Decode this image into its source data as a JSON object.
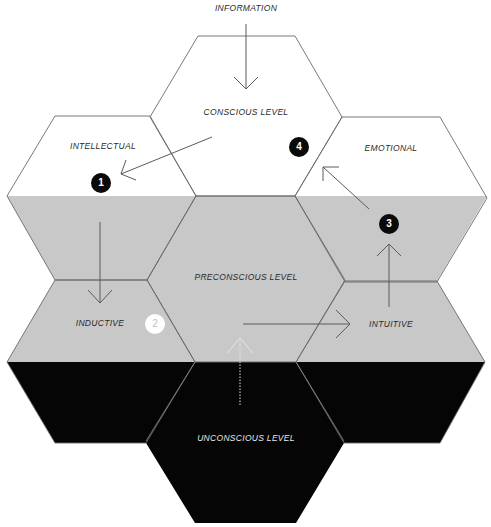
{
  "colors": {
    "white_band": "#ffffff",
    "gray_band": "#c8c8c8",
    "black_band": "#050505",
    "outline": "#6a6a6a",
    "arrow": "#5a5a5a",
    "arrow_light": "#e6e6e6"
  },
  "labels": {
    "information": "INFORMATION",
    "conscious": "CONSCIOUS LEVEL",
    "intellectual": "INTELLECTUAL",
    "emotional": "EMOTIONAL",
    "preconscious": "PRECONSCIOUS LEVEL",
    "inductive": "INDUCTIVE",
    "intuitive": "INTUITIVE",
    "unconscious": "UNCONSCIOUS LEVEL"
  },
  "badges": [
    {
      "number": "1",
      "style": "black"
    },
    {
      "number": "2",
      "style": "white"
    },
    {
      "number": "3",
      "style": "black"
    },
    {
      "number": "4",
      "style": "black"
    }
  ]
}
